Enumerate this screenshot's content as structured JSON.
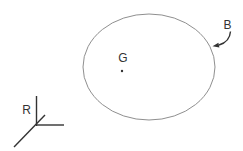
{
  "figure": {
    "background": "#ffffff",
    "labels": {
      "body": "B",
      "center_of_gravity": "G",
      "reference_frame": "R"
    },
    "colors": {
      "outline": "#8f8f8f",
      "ink": "#333333"
    }
  }
}
